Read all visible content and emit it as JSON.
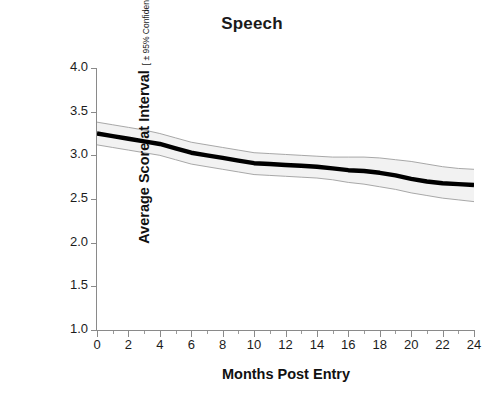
{
  "chart_data": {
    "type": "line",
    "title": "Speech",
    "xlabel": "Months Post Entry",
    "ylabel": "Average Score at Interval",
    "ylabel_subtitle": "[ ± 95% Confidence Interval ]",
    "xlim": [
      0,
      24
    ],
    "ylim": [
      1.0,
      4.0
    ],
    "grid": false,
    "legend": null,
    "xticks": [
      0,
      2,
      4,
      6,
      8,
      10,
      12,
      14,
      16,
      18,
      20,
      22,
      24
    ],
    "xtick_labels": [
      "0",
      "2",
      "4",
      "6",
      "8",
      "10",
      "12",
      "14",
      "16",
      "18",
      "20",
      "22",
      "24"
    ],
    "yticks": [
      1.0,
      1.5,
      2.0,
      2.5,
      3.0,
      3.5,
      4.0
    ],
    "ytick_labels": [
      "1.0",
      "1.5",
      "2.0",
      "2.5",
      "3.0",
      "3.5",
      "4.0"
    ],
    "x": [
      0,
      1,
      2,
      3,
      4,
      5,
      6,
      7,
      8,
      9,
      10,
      11,
      12,
      13,
      14,
      15,
      16,
      17,
      18,
      19,
      20,
      21,
      22,
      23,
      24
    ],
    "series": [
      {
        "name": "Average Score",
        "style": "thick-black-line",
        "color": "#000000",
        "values": [
          3.25,
          3.22,
          3.19,
          3.16,
          3.13,
          3.08,
          3.03,
          3.0,
          2.97,
          2.94,
          2.91,
          2.9,
          2.89,
          2.88,
          2.87,
          2.85,
          2.83,
          2.82,
          2.8,
          2.77,
          2.73,
          2.7,
          2.68,
          2.67,
          2.66
        ]
      }
    ],
    "confidence_band": {
      "name": "95% Confidence Interval",
      "fill_color": "#f2f2f2",
      "edge_color": "#9e9e9e",
      "upper": [
        3.38,
        3.35,
        3.32,
        3.29,
        3.25,
        3.2,
        3.15,
        3.12,
        3.09,
        3.06,
        3.03,
        3.02,
        3.01,
        3.0,
        2.99,
        2.98,
        2.98,
        2.98,
        2.97,
        2.95,
        2.93,
        2.9,
        2.87,
        2.85,
        2.84
      ],
      "lower": [
        3.12,
        3.09,
        3.06,
        3.03,
        3.0,
        2.95,
        2.9,
        2.87,
        2.84,
        2.81,
        2.78,
        2.77,
        2.76,
        2.75,
        2.74,
        2.72,
        2.69,
        2.67,
        2.64,
        2.61,
        2.57,
        2.54,
        2.51,
        2.49,
        2.47
      ]
    },
    "axis_color": "#8a8a8a"
  }
}
